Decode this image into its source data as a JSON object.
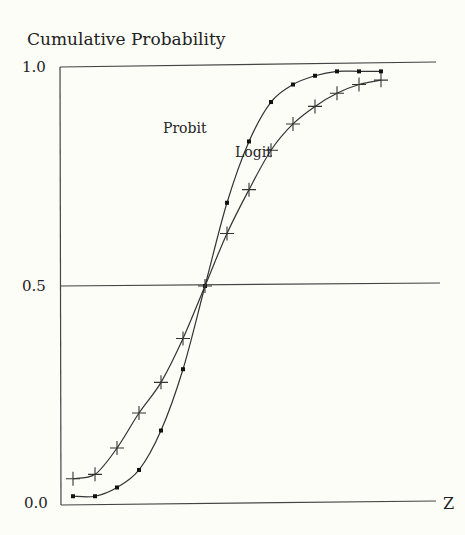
{
  "chart_data": {
    "type": "line",
    "title": "",
    "ylabel": "Cumulative Probability",
    "xlabel": "Z",
    "ylim": [
      0,
      1
    ],
    "yticks": [
      "0.0",
      "0.5",
      "1.0"
    ],
    "grid": "horizontal lines at 0.0, 0.5, 1.0",
    "x": [
      -7,
      -6,
      -5,
      -4,
      -3,
      -2,
      -1,
      0,
      1,
      2,
      3,
      4,
      5,
      6,
      7
    ],
    "series": [
      {
        "name": "Probit",
        "marker": "square-dot",
        "values": [
          0.02,
          0.02,
          0.04,
          0.08,
          0.17,
          0.31,
          0.5,
          0.69,
          0.83,
          0.92,
          0.96,
          0.98,
          0.99,
          0.99,
          0.99
        ]
      },
      {
        "name": "Logit",
        "marker": "plus",
        "values": [
          0.06,
          0.07,
          0.13,
          0.21,
          0.28,
          0.38,
          0.5,
          0.62,
          0.72,
          0.81,
          0.87,
          0.91,
          0.94,
          0.96,
          0.97
        ]
      }
    ],
    "annotations": [
      {
        "text": "Probit",
        "near": "upper curve"
      },
      {
        "text": "Logit",
        "near": "lower curve"
      }
    ]
  },
  "labels": {
    "y_title": "Cumulative Probability",
    "y_top": "1.0",
    "y_mid": "0.5",
    "y_bottom": "0.0",
    "x_axis": "Z",
    "probit": "Probit",
    "logit": "Logit"
  }
}
